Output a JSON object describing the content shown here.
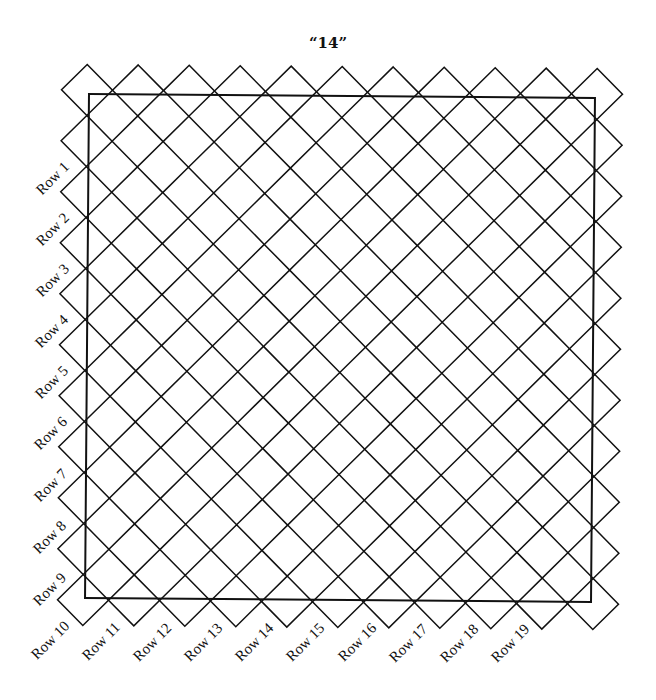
{
  "title": "“14”",
  "grid": {
    "columns": 11,
    "rows": 11,
    "origin_x": 85,
    "origin_y": 92,
    "spacing": 51,
    "half_diagonal": 25.5,
    "line_color": "#111111",
    "rotation_deg": 0.45
  },
  "frame": {
    "x": 87,
    "y": 96,
    "width": 506,
    "height": 504,
    "color": "#111111"
  },
  "left_labels": [
    {
      "label": "Row 1",
      "cx": 53,
      "cy": 178
    },
    {
      "label": "Row 2",
      "cx": 53,
      "cy": 229
    },
    {
      "label": "Row 3",
      "cx": 53,
      "cy": 280
    },
    {
      "label": "Row 4",
      "cx": 52,
      "cy": 331
    },
    {
      "label": "Row 5",
      "cx": 52,
      "cy": 382
    },
    {
      "label": "Row 6",
      "cx": 51,
      "cy": 433
    },
    {
      "label": "Row 7",
      "cx": 51,
      "cy": 485
    },
    {
      "label": "Row 8",
      "cx": 50,
      "cy": 537
    },
    {
      "label": "Row 9",
      "cx": 50,
      "cy": 589
    }
  ],
  "bottom_labels": [
    {
      "label": "Row 10",
      "cx": 50,
      "cy": 640
    },
    {
      "label": "Row 11",
      "cx": 101,
      "cy": 641
    },
    {
      "label": "Row 12",
      "cx": 152,
      "cy": 642
    },
    {
      "label": "Row 13",
      "cx": 203,
      "cy": 642
    },
    {
      "label": "Row 14",
      "cx": 254,
      "cy": 642
    },
    {
      "label": "Row 15",
      "cx": 305,
      "cy": 642
    },
    {
      "label": "Row 16",
      "cx": 357,
      "cy": 642
    },
    {
      "label": "Row 17",
      "cx": 408,
      "cy": 643
    },
    {
      "label": "Row 18",
      "cx": 459,
      "cy": 643
    },
    {
      "label": "Row 19",
      "cx": 510,
      "cy": 643
    }
  ]
}
